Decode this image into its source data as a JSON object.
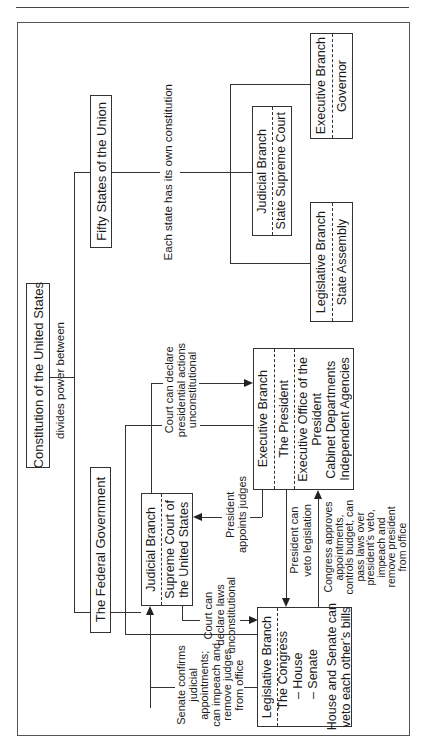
{
  "diagram": {
    "title": "Constitution of the United States",
    "subtitle": "divides power between",
    "levels": {
      "federal": {
        "label": "The Federal Government",
        "branches": {
          "legislative": {
            "name": "Legislative Branch",
            "body": "The Congress",
            "members": [
              "– House",
              "– Senate"
            ],
            "note_line1": "House and Senate can",
            "note_line2": "veto each other’s bills"
          },
          "judicial": {
            "name": "Judicial Branch",
            "body_line1": "Supreme Court of",
            "body_line2": "the United States"
          },
          "executive": {
            "name": "Executive Branch",
            "body": "The President",
            "offices": [
              "Executive Office of the",
              "President",
              "Cabinet Departments",
              "Independent Agencies"
            ]
          }
        }
      },
      "state": {
        "label": "Fifty States of the Union",
        "note": "Each state has its own constitution",
        "branches": {
          "legislative": {
            "name": "Legislative Branch",
            "body": "State Assembly"
          },
          "judicial": {
            "name": "Judicial Branch",
            "body": "State Supreme Court"
          },
          "executive": {
            "name": "Executive Branch",
            "body": "Governor"
          }
        }
      }
    },
    "checks": {
      "court_presidential": [
        "Court can declare",
        "presidential actions",
        "unconstitutional"
      ],
      "president_appoints": [
        "President",
        "appoints judges"
      ],
      "court_laws": [
        "Court can",
        "declare laws",
        "unconstitutional"
      ],
      "president_veto": [
        "President can",
        "veto legislation"
      ],
      "congress_powers": [
        "Congress approves",
        "appointments,",
        "controls budget, can",
        "pass laws over",
        "president’s veto,",
        "impeach and",
        "remove president",
        "from office"
      ],
      "senate_confirms": [
        "Senate confirms",
        "judicial",
        "appointments;",
        "can impeach and",
        "remove judges",
        "from office"
      ]
    }
  }
}
